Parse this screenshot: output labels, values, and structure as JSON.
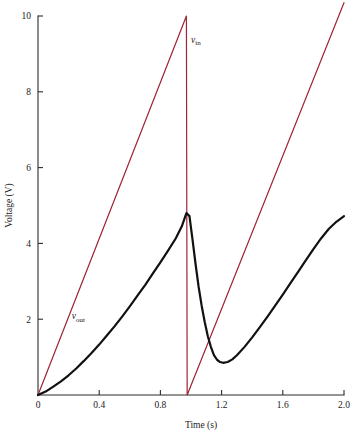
{
  "chart_data": {
    "type": "line",
    "title": "",
    "xlabel": "Time (s)",
    "ylabel": "Voltage (V)",
    "xlim": [
      0,
      2.0
    ],
    "ylim": [
      0,
      10
    ],
    "grid": false,
    "legend_position": "inline-annotation",
    "xticks": [
      0,
      0.4,
      0.8,
      1.2,
      1.6,
      2.0
    ],
    "xtick_labels": [
      "0",
      "0.4",
      "0.8",
      "1.2",
      "1.6",
      "2.0"
    ],
    "yticks": [
      0,
      2,
      4,
      6,
      8,
      10
    ],
    "ytick_labels": [
      "0",
      "2",
      "4",
      "6",
      "8",
      "10"
    ],
    "annotations": [
      {
        "text": "v",
        "subscript": "in",
        "x": 1.0,
        "y": 9.3
      },
      {
        "text": "v",
        "subscript": "out",
        "x": 0.22,
        "y": 2.0
      }
    ],
    "series": [
      {
        "name": "v_in",
        "color": "#9e2436",
        "width": 1.2,
        "description": "sawtooth input, 0 to 10 V, period 1 s",
        "points": [
          [
            0.0,
            0.0
          ],
          [
            0.97,
            10.0
          ],
          [
            0.975,
            0.0
          ],
          [
            2.0,
            10.35
          ]
        ]
      },
      {
        "name": "v_out",
        "color": "#111111",
        "width": 2.2,
        "description": "RC-filtered output: exponential charge then discharge each period",
        "points": [
          [
            0.0,
            0.0
          ],
          [
            0.05,
            0.09
          ],
          [
            0.1,
            0.22
          ],
          [
            0.15,
            0.36
          ],
          [
            0.2,
            0.52
          ],
          [
            0.25,
            0.7
          ],
          [
            0.3,
            0.9
          ],
          [
            0.35,
            1.11
          ],
          [
            0.4,
            1.33
          ],
          [
            0.45,
            1.57
          ],
          [
            0.5,
            1.81
          ],
          [
            0.55,
            2.07
          ],
          [
            0.6,
            2.34
          ],
          [
            0.65,
            2.62
          ],
          [
            0.7,
            2.9
          ],
          [
            0.75,
            3.2
          ],
          [
            0.8,
            3.5
          ],
          [
            0.85,
            3.81
          ],
          [
            0.9,
            4.13
          ],
          [
            0.94,
            4.45
          ],
          [
            0.97,
            4.8
          ],
          [
            0.99,
            4.72
          ],
          [
            1.01,
            4.1
          ],
          [
            1.03,
            3.45
          ],
          [
            1.05,
            2.85
          ],
          [
            1.07,
            2.35
          ],
          [
            1.09,
            1.92
          ],
          [
            1.11,
            1.55
          ],
          [
            1.13,
            1.27
          ],
          [
            1.15,
            1.05
          ],
          [
            1.17,
            0.93
          ],
          [
            1.19,
            0.87
          ],
          [
            1.21,
            0.85
          ],
          [
            1.24,
            0.87
          ],
          [
            1.27,
            0.94
          ],
          [
            1.3,
            1.05
          ],
          [
            1.35,
            1.27
          ],
          [
            1.4,
            1.52
          ],
          [
            1.45,
            1.79
          ],
          [
            1.5,
            2.07
          ],
          [
            1.55,
            2.36
          ],
          [
            1.6,
            2.65
          ],
          [
            1.65,
            2.95
          ],
          [
            1.7,
            3.25
          ],
          [
            1.75,
            3.55
          ],
          [
            1.8,
            3.85
          ],
          [
            1.85,
            4.13
          ],
          [
            1.9,
            4.38
          ],
          [
            1.95,
            4.57
          ],
          [
            2.0,
            4.72
          ]
        ]
      }
    ]
  },
  "figure": {
    "background": "#ffffff",
    "axis_color": "#2b2b2b"
  }
}
